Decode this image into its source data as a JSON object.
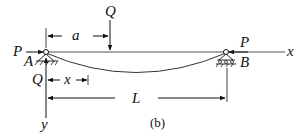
{
  "figure": {
    "caption": "(b)",
    "labels": {
      "load_top": "Q",
      "dim_a": "a",
      "axial_left": "P",
      "axial_right": "P",
      "axis_x": "x",
      "support_left": "A",
      "support_right": "B",
      "reaction_left": "Q",
      "dim_x": "x",
      "dim_L": "L",
      "axis_y": "y"
    },
    "colors": {
      "line": "#111111",
      "beam": "#555555",
      "background": "#ffffff"
    }
  }
}
